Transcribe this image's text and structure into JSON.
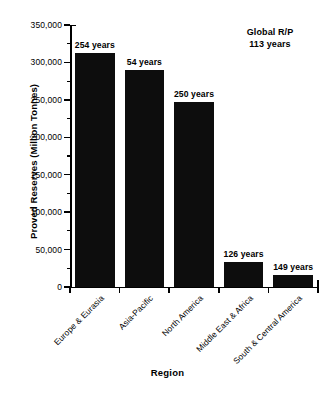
{
  "chart_data": {
    "type": "bar",
    "title": "",
    "xlabel": "Region",
    "ylabel": "Proved Reserves (Million Tonnes)",
    "categories": [
      "Europe & Eurasia",
      "Asia-Pacific",
      "North America",
      "Middle East & Africa",
      "South & Central America"
    ],
    "values": [
      312000,
      290000,
      247000,
      34000,
      16000
    ],
    "point_labels": [
      "254 years",
      "54 years",
      "250 years",
      "126 years",
      "149 years"
    ],
    "ylim": [
      0,
      350000
    ],
    "ytick_values": [
      0,
      50000,
      100000,
      150000,
      200000,
      250000,
      300000,
      350000
    ],
    "ytick_labels": [
      "0",
      "50,000",
      "100,000",
      "150,000",
      "200,000",
      "250,000",
      "300,000",
      "350,000"
    ],
    "grid": false,
    "legend": "none",
    "bar_color": "#0d0d0d",
    "annotations": [
      {
        "line1": "Global R/P",
        "line2": "113 years"
      }
    ]
  }
}
